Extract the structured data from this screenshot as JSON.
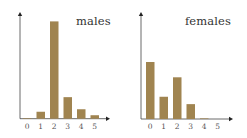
{
  "chart_data": [
    {
      "type": "bar",
      "title": "males",
      "categories": [
        "0",
        "1",
        "2",
        "3",
        "4",
        "5"
      ],
      "values": [
        0.004,
        0.05,
        0.7,
        0.155,
        0.068,
        0.025
      ],
      "xlabel": "",
      "ylabel": "",
      "ylim": [
        0,
        0.75
      ],
      "grid": false,
      "legend": "none",
      "bar_color": "#a08450"
    },
    {
      "type": "bar",
      "title": "females",
      "categories": [
        "0",
        "1",
        "2",
        "3",
        "4",
        "5"
      ],
      "values": [
        0.41,
        0.16,
        0.3,
        0.107,
        0.004,
        0.0
      ],
      "xlabel": "",
      "ylabel": "",
      "ylim": [
        0,
        0.75
      ],
      "grid": false,
      "legend": "none",
      "bar_color": "#a08450"
    }
  ],
  "panels": [
    {
      "title": "males"
    },
    {
      "title": "females"
    }
  ],
  "ticks": [
    "0",
    "1",
    "2",
    "3",
    "4",
    "5"
  ],
  "colors": {
    "bar": "#a08450",
    "axis": "#444444"
  }
}
